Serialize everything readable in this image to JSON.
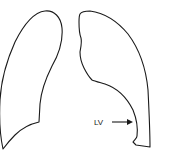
{
  "diagram": {
    "type": "anatomical-line-drawing",
    "colors": {
      "background": "#ffffff",
      "stroke": "#1a1a1a"
    },
    "shapes": [
      {
        "name": "left-lung-outline"
      },
      {
        "name": "right-lung-outline"
      }
    ],
    "annotations": [
      {
        "label": "LV",
        "arrow_direction": "right"
      }
    ]
  }
}
